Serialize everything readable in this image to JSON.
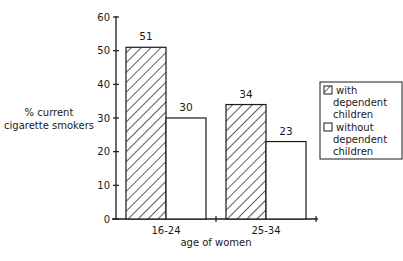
{
  "chart_data": {
    "type": "bar",
    "title": "",
    "xlabel": "age of women",
    "ylabel": "% current cigarette smokers",
    "ylabel_lines": [
      "% current",
      "cigarette smokers"
    ],
    "categories": [
      "16-24",
      "25-34"
    ],
    "series": [
      {
        "name": "with dependent children",
        "pattern": "hatched",
        "values": [
          51,
          34
        ]
      },
      {
        "name": "without dependent children",
        "pattern": "plain",
        "values": [
          30,
          23
        ]
      }
    ],
    "ylim": [
      0,
      60
    ],
    "yticks": [
      0,
      10,
      20,
      30,
      40,
      50,
      60
    ],
    "grid": false,
    "legend_position": "right",
    "data_labels": true
  },
  "legend": {
    "items": [
      {
        "lines": [
          "with",
          "dependent",
          "children"
        ]
      },
      {
        "lines": [
          "without",
          "dependent",
          "children"
        ]
      }
    ]
  },
  "colors": {
    "ink": "#1a1a1a",
    "background": "#ffffff"
  }
}
